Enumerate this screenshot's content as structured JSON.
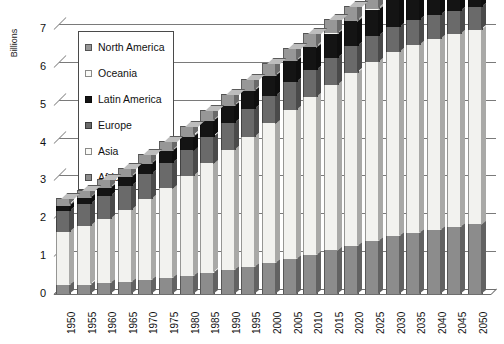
{
  "chart_data": {
    "type": "bar",
    "stacked": true,
    "title": "",
    "subtitle": "",
    "xlabel": "",
    "ylabel": "Billions",
    "ylim": [
      0,
      7
    ],
    "yticks": [
      0,
      1,
      2,
      3,
      4,
      5,
      6,
      7
    ],
    "grid": true,
    "legend_position": "upper-left-inside",
    "style_note": "3D stacked column chart",
    "categories": [
      "1950",
      "1955",
      "1960",
      "1965",
      "1970",
      "1975",
      "1980",
      "1985",
      "1990",
      "1995",
      "2000",
      "2005",
      "2010",
      "2015",
      "2020",
      "2025",
      "2030",
      "2035",
      "2040",
      "2045",
      "2050"
    ],
    "series": [
      {
        "name": "Africa",
        "color": "#8c8c8c",
        "values": [
          0.23,
          0.25,
          0.28,
          0.32,
          0.36,
          0.41,
          0.48,
          0.56,
          0.63,
          0.71,
          0.81,
          0.92,
          1.03,
          1.15,
          1.28,
          1.4,
          1.52,
          1.62,
          1.7,
          1.77,
          1.84
        ]
      },
      {
        "name": "Asia",
        "color": "#f2f2ef",
        "values": [
          1.4,
          1.54,
          1.7,
          1.9,
          2.14,
          2.38,
          2.63,
          2.89,
          3.18,
          3.44,
          3.7,
          3.94,
          4.17,
          4.38,
          4.57,
          4.73,
          4.87,
          4.97,
          5.05,
          5.1,
          5.14
        ]
      },
      {
        "name": "Europe",
        "color": "#6a6a6a",
        "values": [
          0.55,
          0.58,
          0.61,
          0.63,
          0.66,
          0.68,
          0.69,
          0.71,
          0.72,
          0.73,
          0.73,
          0.73,
          0.72,
          0.71,
          0.7,
          0.69,
          0.67,
          0.65,
          0.63,
          0.61,
          0.59
        ]
      },
      {
        "name": "Latin America",
        "color": "#141414",
        "values": [
          0.17,
          0.19,
          0.22,
          0.25,
          0.29,
          0.32,
          0.36,
          0.4,
          0.44,
          0.48,
          0.52,
          0.56,
          0.6,
          0.63,
          0.66,
          0.69,
          0.71,
          0.72,
          0.73,
          0.74,
          0.74
        ]
      },
      {
        "name": "Oceania",
        "color": "#fafaf7",
        "values": [
          0.01,
          0.01,
          0.02,
          0.02,
          0.02,
          0.02,
          0.02,
          0.03,
          0.03,
          0.03,
          0.03,
          0.03,
          0.04,
          0.04,
          0.04,
          0.04,
          0.05,
          0.05,
          0.05,
          0.05,
          0.06
        ]
      },
      {
        "name": "North America",
        "color": "#979797",
        "values": [
          0.17,
          0.19,
          0.2,
          0.21,
          0.23,
          0.24,
          0.25,
          0.26,
          0.28,
          0.29,
          0.31,
          0.33,
          0.34,
          0.36,
          0.37,
          0.39,
          0.4,
          0.41,
          0.42,
          0.43,
          0.44
        ]
      }
    ],
    "totals": [
      2.53,
      2.76,
      3.03,
      3.33,
      3.7,
      4.05,
      4.43,
      4.85,
      5.28,
      5.68,
      6.1,
      6.51,
      6.9,
      7.27,
      7.62,
      7.94,
      8.22,
      8.42,
      8.58,
      8.7,
      8.81
    ]
  },
  "legend": {
    "items": [
      {
        "label": "North America",
        "color": "#979797"
      },
      {
        "label": "Oceania",
        "color": "#fafaf7"
      },
      {
        "label": "Latin America",
        "color": "#141414"
      },
      {
        "label": "Europe",
        "color": "#6a6a6a"
      },
      {
        "label": "Asia",
        "color": "#fafaf7"
      },
      {
        "label": "Africa",
        "color": "#8c8c8c"
      }
    ]
  },
  "axes": {
    "y_title": "Billions",
    "y_tick_labels": [
      "7",
      "6",
      "5",
      "4",
      "3",
      "2",
      "1",
      "0"
    ],
    "x_tick_labels": [
      "1950",
      "1955",
      "1960",
      "1965",
      "1970",
      "1975",
      "1980",
      "1985",
      "1990",
      "1995",
      "2000",
      "2005",
      "2010",
      "2015",
      "2020",
      "2025",
      "2030",
      "2035",
      "2040",
      "2045",
      "2050"
    ]
  }
}
